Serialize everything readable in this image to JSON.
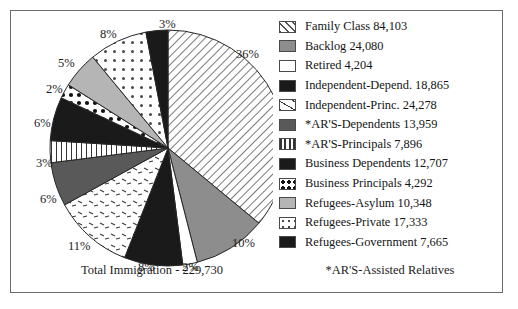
{
  "chart_data": {
    "type": "pie",
    "title": "",
    "total_label": "Total Immigration - 229,730",
    "footnote": "*AR'S-Assisted Relatives",
    "legend_position": "right",
    "categories": [
      "Family Class",
      "Backlog",
      "Retired",
      "Independent-Depend.",
      "Independent-Princ.",
      "*AR'S-Dependents",
      "*AR'S-Principals",
      "Business Dependents",
      "Business Principals",
      "Refugees-Asylum",
      "Refugees-Private",
      "Refugees-Government"
    ],
    "values": [
      84103,
      24080,
      4204,
      18865,
      24278,
      13959,
      7896,
      12707,
      4292,
      10348,
      17333,
      7665
    ],
    "percent_labels": [
      "36%",
      "10%",
      "2%",
      "8%",
      "11%",
      "6%",
      "3%",
      "6%",
      "2%",
      "5%",
      "8%",
      "3%"
    ],
    "percents": [
      36,
      10,
      2,
      8,
      11,
      6,
      3,
      6,
      2,
      5,
      8,
      3
    ],
    "total": 229730,
    "patterns": [
      "diagonal-stripes",
      "solid-medium-gray",
      "solid-white",
      "solid-black",
      "sparse-dashes",
      "solid-dark-gray",
      "vertical-lines",
      "solid-black",
      "white-large-dots",
      "solid-light-gray",
      "white-small-dots",
      "solid-black"
    ],
    "colors": [
      "#ffffff",
      "#8d8d8d",
      "#ffffff",
      "#1a1a1a",
      "#ffffff",
      "#595959",
      "#ffffff",
      "#1a1a1a",
      "#ffffff",
      "#b5b5b5",
      "#ffffff",
      "#1a1a1a"
    ]
  },
  "legend": {
    "items": [
      {
        "label": "Family Class 84,103",
        "swatch": "diagonal-stripes-swatch"
      },
      {
        "label": "Backlog 24,080",
        "swatch": "medium-gray-swatch"
      },
      {
        "label": "Retired 4,204",
        "swatch": "white-swatch"
      },
      {
        "label": "Independent-Depend. 18,865",
        "swatch": "black-swatch"
      },
      {
        "label": "Independent-Princ. 24,278",
        "swatch": "sparse-dashes-swatch"
      },
      {
        "label": "*AR'S-Dependents 13,959",
        "swatch": "dark-gray-swatch"
      },
      {
        "label": "*AR'S-Principals 7,896",
        "swatch": "vertical-lines-swatch"
      },
      {
        "label": "Business Dependents 12,707",
        "swatch": "black-swatch"
      },
      {
        "label": "Business Principals 4,292",
        "swatch": "large-dots-swatch"
      },
      {
        "label": "Refugees-Asylum 10,348",
        "swatch": "light-gray-swatch"
      },
      {
        "label": "Refugees-Private 17,333",
        "swatch": "small-dots-swatch"
      },
      {
        "label": "Refugees-Government 7,665",
        "swatch": "black-swatch"
      }
    ]
  },
  "pie_labels": [
    {
      "text": "3%",
      "x": 148,
      "y": 6
    },
    {
      "text": "8%",
      "x": 89,
      "y": 16
    },
    {
      "text": "5%",
      "x": 47,
      "y": 45
    },
    {
      "text": "2%",
      "x": 35,
      "y": 71
    },
    {
      "text": "6%",
      "x": 23,
      "y": 105
    },
    {
      "text": "3%",
      "x": 25,
      "y": 145
    },
    {
      "text": "6%",
      "x": 29,
      "y": 181
    },
    {
      "text": "11%",
      "x": 57,
      "y": 228
    },
    {
      "text": "8%",
      "x": 127,
      "y": 249
    },
    {
      "text": "2%",
      "x": 171,
      "y": 249
    },
    {
      "text": "10%",
      "x": 221,
      "y": 225
    },
    {
      "text": "36%",
      "x": 225,
      "y": 36
    }
  ]
}
